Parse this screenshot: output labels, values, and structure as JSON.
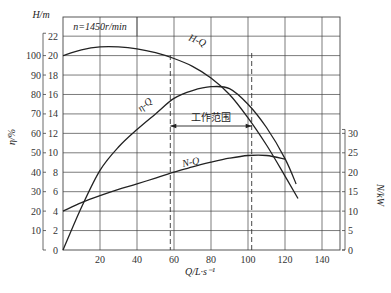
{
  "chart_data": {
    "type": "line",
    "title": "",
    "annotation_speed": "n=1450r/min",
    "xlabel": "Q/L·s⁻¹",
    "x_axis": {
      "min": 0,
      "max": 150,
      "ticks": [
        20,
        40,
        60,
        80,
        100,
        120,
        140
      ]
    },
    "left_axis_H": {
      "label": "H/m",
      "min": 0,
      "max": 24,
      "ticks": [
        0,
        2,
        4,
        6,
        8,
        10,
        12,
        14,
        16,
        18,
        20,
        22
      ]
    },
    "left_axis_eta": {
      "label": "η/%",
      "ticks": [
        10,
        20,
        30,
        40,
        50,
        60,
        70,
        80,
        90,
        100
      ]
    },
    "right_axis_N": {
      "label": "N/kW",
      "ticks": [
        0,
        5,
        10,
        15,
        20,
        25,
        30
      ]
    },
    "grid": true,
    "series": [
      {
        "name": "H-Q",
        "axis": "H (m)",
        "x": [
          0,
          10,
          20,
          30,
          40,
          50,
          60,
          70,
          80,
          90,
          100,
          110,
          120,
          127
        ],
        "values": [
          20.0,
          20.6,
          20.9,
          20.9,
          20.7,
          20.3,
          19.7,
          18.9,
          17.7,
          16.0,
          13.6,
          10.8,
          7.6,
          5.3
        ]
      },
      {
        "name": "η-Q",
        "axis": "η (%)",
        "x": [
          0,
          10,
          20,
          30,
          40,
          50,
          60,
          70,
          80,
          90,
          100,
          110,
          120,
          126
        ],
        "values": [
          0,
          22,
          41,
          53,
          62,
          70,
          78,
          82,
          84,
          83,
          75,
          63,
          47,
          34
        ]
      },
      {
        "name": "N-Q",
        "axis": "N (kW)",
        "x": [
          0,
          10,
          20,
          30,
          40,
          50,
          60,
          70,
          80,
          90,
          100,
          110,
          120
        ],
        "values": [
          10.0,
          12.2,
          14.0,
          15.6,
          17.0,
          18.5,
          20.0,
          21.4,
          22.6,
          23.6,
          24.3,
          24.3,
          23.4
        ]
      }
    ],
    "working_range": {
      "label": "工作范围",
      "q_min": 58,
      "q_max": 102
    },
    "curve_labels": {
      "hq": "H-Q",
      "etaq": "η-Q",
      "nq": "N-Q"
    }
  },
  "labels": {
    "speed": "n=1450r/min",
    "h_axis": "H/m",
    "eta_axis": "η/%",
    "n_axis": "N/kW",
    "x_axis": "Q/L·s⁻¹",
    "working_range": "工作范围",
    "hq": "H-Q",
    "etaq": "η-Q",
    "nq": "N-Q"
  }
}
